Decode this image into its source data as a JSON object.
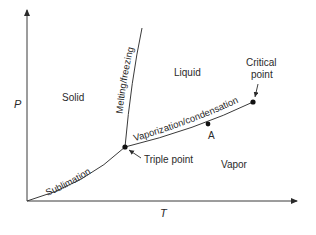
{
  "diagram": {
    "axes": {
      "x_label": "T",
      "y_label": "P"
    },
    "regions": {
      "solid": "Solid",
      "liquid": "Liquid",
      "vapor": "Vapor"
    },
    "curves": {
      "sublimation": "Sublimation",
      "melting": "Melting/freezing",
      "vaporization": "Vaporization/condensation"
    },
    "points": {
      "triple": "Triple point",
      "critical_line1": "Critical",
      "critical_line2": "point",
      "a": "A"
    },
    "colors": {
      "line": "#3a3a3a",
      "text": "#2a2a2a",
      "background": "#ffffff"
    }
  }
}
